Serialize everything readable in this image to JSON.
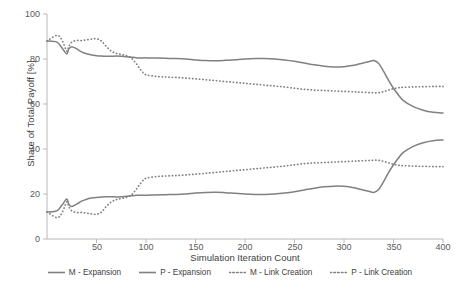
{
  "chart_data": {
    "type": "line",
    "title": "",
    "xlabel": "Simulation Iteration Count",
    "ylabel": "Share of Total Payoff [%]",
    "xlim": [
      0,
      400
    ],
    "ylim": [
      0,
      100
    ],
    "xticks": [
      50,
      100,
      150,
      200,
      250,
      300,
      350,
      400
    ],
    "yticks": [
      0,
      20,
      40,
      60,
      80,
      100
    ],
    "grid": false,
    "legend_position": "bottom",
    "colors": {
      "line": "#808080",
      "axis": "#b0b0b0",
      "text": "#404040",
      "tick_text": "#595959",
      "background": "#ffffff"
    },
    "x": [
      0,
      10,
      15,
      20,
      22,
      25,
      30,
      35,
      40,
      45,
      50,
      55,
      60,
      65,
      70,
      75,
      80,
      85,
      90,
      95,
      100,
      110,
      120,
      130,
      140,
      150,
      160,
      170,
      180,
      190,
      200,
      210,
      220,
      230,
      240,
      250,
      260,
      270,
      280,
      290,
      300,
      310,
      315,
      320,
      325,
      330,
      335,
      340,
      345,
      350,
      355,
      360,
      370,
      380,
      390,
      400
    ],
    "series": [
      {
        "name": "M - Expansion",
        "style": "solid",
        "values": [
          88,
          87.5,
          85,
          82.2,
          84.5,
          85.5,
          84.5,
          83.2,
          82.3,
          81.8,
          81.5,
          81.3,
          81.2,
          81.2,
          81.3,
          81.2,
          81.0,
          80.8,
          80.6,
          80.5,
          80.5,
          80.4,
          80.3,
          80.2,
          80.0,
          79.6,
          79.3,
          79.2,
          79.4,
          79.7,
          80.0,
          80.2,
          80.2,
          80.0,
          79.6,
          79.0,
          78.2,
          77.4,
          76.8,
          76.5,
          76.6,
          77.2,
          77.8,
          78.3,
          78.8,
          79.3,
          78.0,
          74.5,
          70.5,
          67.0,
          64.0,
          61.5,
          58.8,
          57.2,
          56.3,
          56.0
        ]
      },
      {
        "name": "P - Expansion",
        "style": "solid",
        "values": [
          12,
          12.5,
          15,
          17.8,
          15.5,
          14.5,
          15.5,
          16.8,
          17.7,
          18.2,
          18.5,
          18.7,
          18.8,
          18.8,
          18.7,
          18.8,
          19.0,
          19.2,
          19.4,
          19.5,
          19.5,
          19.6,
          19.7,
          19.8,
          20.0,
          20.4,
          20.7,
          20.8,
          20.6,
          20.3,
          20.0,
          19.8,
          19.8,
          20.0,
          20.4,
          21.0,
          21.8,
          22.6,
          23.2,
          23.5,
          23.4,
          22.8,
          22.2,
          21.7,
          21.2,
          20.7,
          22.0,
          25.5,
          29.5,
          33.0,
          36.0,
          38.5,
          41.2,
          42.8,
          43.7,
          44.0
        ]
      },
      {
        "name": "M - Link Creation",
        "style": "dotted",
        "values": [
          88,
          90.5,
          88.5,
          83.5,
          85.5,
          87.5,
          88.2,
          88.2,
          88.5,
          88.8,
          89.0,
          88.0,
          85.5,
          83.5,
          82.5,
          82.0,
          81.5,
          80.5,
          78.0,
          75.0,
          73.0,
          72.3,
          72.0,
          71.8,
          71.5,
          71.2,
          70.8,
          70.4,
          70.0,
          69.6,
          69.2,
          68.8,
          68.4,
          68.0,
          67.6,
          67.0,
          66.5,
          66.2,
          66.0,
          65.8,
          65.6,
          65.4,
          65.3,
          65.2,
          65.1,
          65.0,
          65.0,
          65.5,
          66.2,
          66.8,
          67.2,
          67.4,
          67.6,
          67.7,
          67.8,
          67.8
        ]
      },
      {
        "name": "P - Link Creation",
        "style": "dotted",
        "values": [
          12,
          9.5,
          11.5,
          16.5,
          14.5,
          12.5,
          11.8,
          11.8,
          11.5,
          11.2,
          11.0,
          12.0,
          14.5,
          16.5,
          17.5,
          18.0,
          18.5,
          19.5,
          22.0,
          25.0,
          27.0,
          27.7,
          28.0,
          28.2,
          28.5,
          28.8,
          29.2,
          29.6,
          30.0,
          30.4,
          30.8,
          31.2,
          31.6,
          32.0,
          32.4,
          33.0,
          33.5,
          33.8,
          34.0,
          34.2,
          34.4,
          34.6,
          34.7,
          34.8,
          34.9,
          35.0,
          35.0,
          34.5,
          33.8,
          33.2,
          32.8,
          32.6,
          32.4,
          32.3,
          32.2,
          32.2
        ]
      }
    ]
  },
  "axes": {
    "y_title": "Share of Total Payoff [%]",
    "x_title": "Simulation Iteration Count",
    "y_labels": [
      "100",
      "80",
      "60",
      "40",
      "20",
      "0"
    ],
    "x_labels": [
      "50",
      "100",
      "150",
      "200",
      "250",
      "300",
      "350",
      "400"
    ]
  },
  "legend": {
    "items": [
      {
        "label": "M - Expansion",
        "style": "solid"
      },
      {
        "label": "P - Expansion",
        "style": "solid"
      },
      {
        "label": "M - Link Creation",
        "style": "dotted"
      },
      {
        "label": "P - Link Creation",
        "style": "dotted"
      }
    ]
  }
}
